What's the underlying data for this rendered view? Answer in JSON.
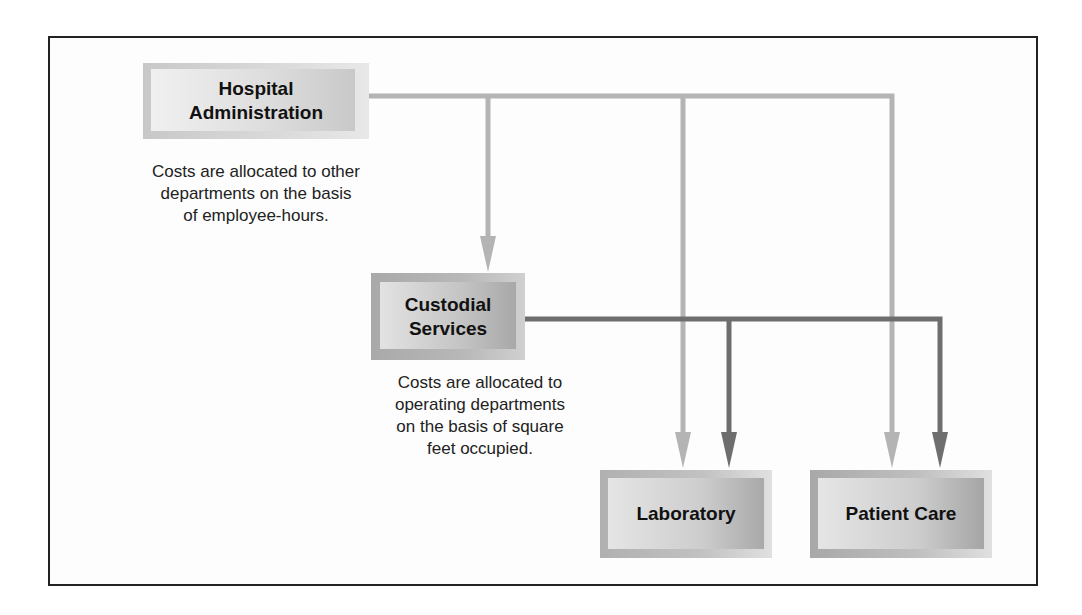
{
  "diagram": {
    "nodes": {
      "admin": {
        "line1": "Hospital",
        "line2": "Administration"
      },
      "custodial": {
        "line1": "Custodial",
        "line2": "Services"
      },
      "laboratory": {
        "label": "Laboratory"
      },
      "patient_care": {
        "label": "Patient Care"
      }
    },
    "notes": {
      "admin_note": {
        "line1": "Costs are allocated to other",
        "line2": "departments on the basis",
        "line3": "of employee-hours."
      },
      "custodial_note": {
        "line1": "Costs are allocated to",
        "line2": "operating departments",
        "line3": "on the basis of square",
        "line4": "feet occupied."
      }
    },
    "colors": {
      "admin_arrows": "#b4b4b4",
      "custodial_arrows": "#6e6e6e",
      "frame_border": "#222222"
    },
    "edges": [
      {
        "from": "Hospital Administration",
        "to": "Custodial Services"
      },
      {
        "from": "Hospital Administration",
        "to": "Laboratory"
      },
      {
        "from": "Hospital Administration",
        "to": "Patient Care"
      },
      {
        "from": "Custodial Services",
        "to": "Laboratory"
      },
      {
        "from": "Custodial Services",
        "to": "Patient Care"
      }
    ]
  }
}
